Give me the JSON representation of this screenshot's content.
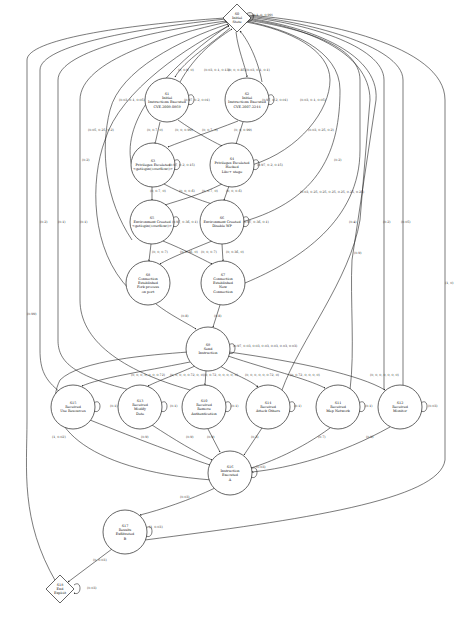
{
  "diagram": {
    "nodes": [
      {
        "id": "S0",
        "lines": [
          "S0",
          "Initial",
          "State"
        ],
        "shape": "diamond",
        "cx": 237,
        "cy": 18
      },
      {
        "id": "S1",
        "lines": [
          "S1",
          "Initial",
          "Instructions Executed",
          "CVE-2009-0869"
        ],
        "shape": "circle",
        "cx": 167,
        "cy": 100
      },
      {
        "id": "S2",
        "lines": [
          "S2",
          "Initial",
          "Instructions Executed",
          "CVE-2007-2244"
        ],
        "shape": "circle",
        "cx": 247,
        "cy": 100
      },
      {
        "id": "S3",
        "lines": [
          "S3",
          "Privileges Escalated",
          "<getlogin()overflow()>"
        ],
        "shape": "circle",
        "cx": 153,
        "cy": 165
      },
      {
        "id": "S4",
        "lines": [
          "S4",
          "Privileges Escalated",
          "Hacked",
          "Libc+ stage"
        ],
        "shape": "circle",
        "cx": 232,
        "cy": 165
      },
      {
        "id": "S5",
        "lines": [
          "S5",
          "Environment Created",
          "<getlogin()overflow()>"
        ],
        "shape": "circle",
        "cx": 152,
        "cy": 222
      },
      {
        "id": "S6",
        "lines": [
          "S6",
          "Environment Created",
          "Disable WP"
        ],
        "shape": "circle",
        "cx": 222,
        "cy": 222
      },
      {
        "id": "S8",
        "lines": [
          "S8",
          "Connection",
          "Established",
          "Fork process",
          "on port"
        ],
        "shape": "circle",
        "cx": 148,
        "cy": 283
      },
      {
        "id": "S7",
        "lines": [
          "S7",
          "Connection",
          "Established",
          "New",
          "Connection"
        ],
        "shape": "circle",
        "cx": 223,
        "cy": 283
      },
      {
        "id": "S9",
        "lines": [
          "S9",
          "Send",
          "Instruction"
        ],
        "shape": "circle",
        "cx": 208,
        "cy": 349
      },
      {
        "id": "S15",
        "lines": [
          "S15",
          "Received",
          "Use Resources"
        ],
        "shape": "circle",
        "cx": 73,
        "cy": 407
      },
      {
        "id": "S13",
        "lines": [
          "S13",
          "Received",
          "Modify",
          "Data"
        ],
        "shape": "circle",
        "cx": 140,
        "cy": 407
      },
      {
        "id": "S10",
        "lines": [
          "S10",
          "Received",
          "Remove",
          "Authentication"
        ],
        "shape": "circle",
        "cx": 204,
        "cy": 407
      },
      {
        "id": "S14",
        "lines": [
          "S14",
          "Received",
          "Attack Others"
        ],
        "shape": "circle",
        "cx": 268,
        "cy": 407
      },
      {
        "id": "S11",
        "lines": [
          "S11",
          "Received",
          "Map Network"
        ],
        "shape": "circle",
        "cx": 338,
        "cy": 407
      },
      {
        "id": "S12",
        "lines": [
          "S12",
          "Received",
          "Monitor"
        ],
        "shape": "circle",
        "cx": 400,
        "cy": 407
      },
      {
        "id": "S16",
        "lines": [
          "S16",
          "Instruction",
          "Executed",
          "A"
        ],
        "shape": "circle",
        "cx": 230,
        "cy": 473
      },
      {
        "id": "S17",
        "lines": [
          "S17",
          "Results",
          "Exfiltrated",
          "B"
        ],
        "shape": "circle",
        "cx": 125,
        "cy": 532
      },
      {
        "id": "S18",
        "lines": [
          "S18",
          "End",
          "Exploit"
        ],
        "shape": "diamond",
        "cx": 60,
        "cy": 589
      }
    ],
    "edge_labels": [
      {
        "text": "(0.1, 0, 0.99)",
        "x": 252,
        "y": 16
      },
      {
        "text": "(0, 0.9, 0)",
        "x": 178,
        "y": 71
      },
      {
        "text": "(0.03, 0.1, 0.13)",
        "x": 204,
        "y": 71
      },
      {
        "text": "(0, 0, 0.85)",
        "x": 228,
        "y": 71
      },
      {
        "text": "(0.03, 0.1, 0.1)",
        "x": 246,
        "y": 71
      },
      {
        "text": "(0.03, 0.1, 0.05)",
        "x": 119,
        "y": 101
      },
      {
        "text": "(0.97, 0.2, 0.01)",
        "x": 184,
        "y": 101
      },
      {
        "text": "(0.97, 0.2, 0.01)",
        "x": 262,
        "y": 101
      },
      {
        "text": "(0.03, 0.1, 0.05)",
        "x": 300,
        "y": 101
      },
      {
        "text": "(0, 0.7, 0)",
        "x": 147,
        "y": 131
      },
      {
        "text": "(0, 0, 0.99)",
        "x": 175,
        "y": 131
      },
      {
        "text": "(0, 0.7, 0)",
        "x": 202,
        "y": 131
      },
      {
        "text": "(0, 0, 0.99)",
        "x": 234,
        "y": 131
      },
      {
        "text": "(0.05, 0.25, 0.2)",
        "x": 88,
        "y": 131
      },
      {
        "text": "(0.03, 0.25, 0.2)",
        "x": 308,
        "y": 131
      },
      {
        "text": "(0.97, 0.2, 0.15)",
        "x": 169,
        "y": 166
      },
      {
        "text": "(0.97, 0.2, 0.15)",
        "x": 257,
        "y": 166
      },
      {
        "text": "(0.2)",
        "x": 82,
        "y": 161
      },
      {
        "text": "(0.2)",
        "x": 334,
        "y": 161
      },
      {
        "text": "(0, 0.7, 0)",
        "x": 150,
        "y": 192
      },
      {
        "text": "(0, 0, 0.6)",
        "x": 179,
        "y": 192
      },
      {
        "text": "(0, 0.7, 0)",
        "x": 202,
        "y": 192
      },
      {
        "text": "(0, 0, 0.6)",
        "x": 226,
        "y": 192
      },
      {
        "text": "(0.03, 0.25, 0.25, 0.25, 0.25, 0.25, 0.25)",
        "x": 300,
        "y": 193
      },
      {
        "text": "(0.97, 0.36, 0.1)",
        "x": 172,
        "y": 223
      },
      {
        "text": "(0.97, 0.36, 0.1)",
        "x": 243,
        "y": 223
      },
      {
        "text": "(0, 0, 0.7)",
        "x": 152,
        "y": 253
      },
      {
        "text": "(0, 0.36, 0)",
        "x": 180,
        "y": 253
      },
      {
        "text": "(0, 0, 0.7)",
        "x": 201,
        "y": 253
      },
      {
        "text": "(0, 0.36, 0)",
        "x": 226,
        "y": 253
      },
      {
        "text": "(0.2)",
        "x": 40,
        "y": 223
      },
      {
        "text": "(0.1)",
        "x": 58,
        "y": 223
      },
      {
        "text": "(0.1)",
        "x": 80,
        "y": 223
      },
      {
        "text": "(0.4)",
        "x": 349,
        "y": 223
      },
      {
        "text": "(0.2)",
        "x": 383,
        "y": 223
      },
      {
        "text": "(0.05)",
        "x": 401,
        "y": 223
      },
      {
        "text": "(0.9)",
        "x": 354,
        "y": 254
      },
      {
        "text": "(1, 0)",
        "x": 445,
        "y": 284
      },
      {
        "text": "(0.99)",
        "x": 27,
        "y": 315
      },
      {
        "text": "(0.8)",
        "x": 181,
        "y": 317
      },
      {
        "text": "(0.8)",
        "x": 214,
        "y": 317
      },
      {
        "text": "(0.97, 0.03, 0.03, 0.03, 0.03, 0.03, 0.03)",
        "x": 233,
        "y": 347
      },
      {
        "text": "(0, 0, 0, 0, 0, 0, 0.72)",
        "x": 131,
        "y": 376
      },
      {
        "text": "(0, 0, 0, 0, 0.72, 0, 0)",
        "x": 170,
        "y": 376
      },
      {
        "text": "(0, 0.72, 0, 0, 0, 0, 0)",
        "x": 204,
        "y": 376
      },
      {
        "text": "(0, 0, 0, 0, 0, 0.72, 0)",
        "x": 245,
        "y": 376
      },
      {
        "text": "(0, 0.72, 0, 0, 0, 0)",
        "x": 290,
        "y": 376
      },
      {
        "text": "(0, 0, 0, 0, 0, 0, 0)",
        "x": 370,
        "y": 376
      },
      {
        "text": "(0.1)",
        "x": 110,
        "y": 407
      },
      {
        "text": "(0.1)",
        "x": 170,
        "y": 407
      },
      {
        "text": "(0.1)",
        "x": 231,
        "y": 407
      },
      {
        "text": "(0.1)",
        "x": 294,
        "y": 407
      },
      {
        "text": "(0.1)",
        "x": 365,
        "y": 407
      },
      {
        "text": "(0.03)",
        "x": 428,
        "y": 407
      },
      {
        "text": "(1, 0.02)",
        "x": 52,
        "y": 438
      },
      {
        "text": "(0.9)",
        "x": 141,
        "y": 438
      },
      {
        "text": "(0.9)",
        "x": 186,
        "y": 438
      },
      {
        "text": "(0.9)",
        "x": 207,
        "y": 438
      },
      {
        "text": "(0.3)",
        "x": 251,
        "y": 438
      },
      {
        "text": "(0.7)",
        "x": 318,
        "y": 438
      },
      {
        "text": "(0.9)",
        "x": 366,
        "y": 438
      },
      {
        "text": "(0.03)",
        "x": 256,
        "y": 468
      },
      {
        "text": "(0.03)",
        "x": 180,
        "y": 498
      },
      {
        "text": "(1, 0.03)",
        "x": 149,
        "y": 528
      },
      {
        "text": "(0, 0.03)",
        "x": 93,
        "y": 561
      },
      {
        "text": "(0.03)",
        "x": 87,
        "y": 589
      }
    ]
  }
}
